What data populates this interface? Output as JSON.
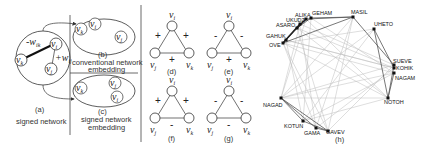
{
  "panel_a": {
    "caption_letter": "(a)",
    "caption": "signed network",
    "edge_neg": "-w",
    "edge_neg_sub": "ik",
    "edge_pos": "+w",
    "edge_pos_sub": "ij",
    "nodes": [
      {
        "name": "v",
        "sub": "k"
      },
      {
        "name": "v",
        "sub": "i"
      },
      {
        "name": "v",
        "sub": "j"
      }
    ]
  },
  "panel_b": {
    "caption_letter": "(b)",
    "caption_line1": "conventional network",
    "caption_line2": "embedding",
    "nodes": [
      {
        "name": "v",
        "sub": "k"
      },
      {
        "name": "v",
        "sub": "i"
      },
      {
        "name": "v",
        "sub": "j"
      }
    ]
  },
  "panel_c": {
    "caption_letter": "(c)",
    "caption_line1": "signed network",
    "caption_line2": "embedding",
    "nodes": [
      {
        "name": "v",
        "sub": "k"
      },
      {
        "name": "v",
        "sub": "j"
      },
      {
        "name": "v",
        "sub": "i"
      }
    ]
  },
  "triangles": [
    {
      "id": "d",
      "caption": "(d)",
      "left": "+",
      "right": "+",
      "bottom": "+",
      "top": "v",
      "top_sub": "i",
      "bl": "v",
      "bl_sub": "j",
      "br": "v",
      "br_sub": "k"
    },
    {
      "id": "e",
      "caption": "(e)",
      "left": "-",
      "right": "-",
      "bottom": "+",
      "top": "v",
      "top_sub": "i",
      "bl": "v",
      "bl_sub": "j",
      "br": "v",
      "br_sub": "k"
    },
    {
      "id": "f",
      "caption": "(f)",
      "left": "+",
      "right": "+",
      "bottom": "-",
      "top": "v",
      "top_sub": "i",
      "bl": "v",
      "bl_sub": "j",
      "br": "v",
      "br_sub": "k"
    },
    {
      "id": "g",
      "caption": "(g)",
      "left": "-",
      "right": "-",
      "bottom": "-",
      "top": "v",
      "top_sub": "i",
      "bl": "v",
      "bl_sub": "j",
      "br": "v",
      "br_sub": "k"
    }
  ],
  "panel_h": {
    "caption": "(h)",
    "nodes": [
      {
        "label": "ALIKA"
      },
      {
        "label": "GEHAM"
      },
      {
        "label": "UKUDZ"
      },
      {
        "label": "ASARO"
      },
      {
        "label": "GAHUK"
      },
      {
        "label": "OVE"
      },
      {
        "label": "MASIL"
      },
      {
        "label": "UHETO"
      },
      {
        "label": "SUEVE"
      },
      {
        "label": "KOHIK"
      },
      {
        "label": "NAGAM"
      },
      {
        "label": "NOTOH"
      },
      {
        "label": "NAGAD"
      },
      {
        "label": "KOTUN"
      },
      {
        "label": "GAMA"
      },
      {
        "label": "GAVEV"
      }
    ]
  }
}
